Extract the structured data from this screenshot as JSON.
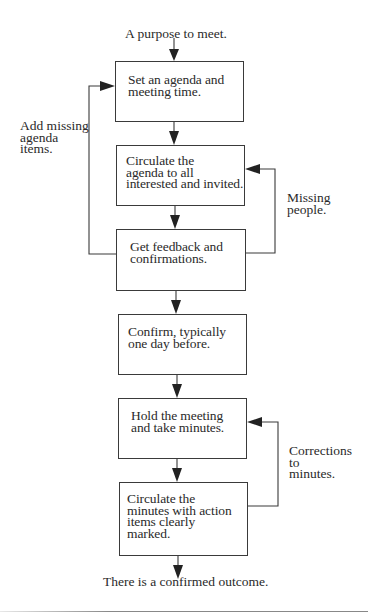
{
  "diagram": {
    "type": "flowchart",
    "start_label": "A purpose to meet.",
    "end_label": "There is a confirmed outcome.",
    "steps": [
      {
        "id": "step-1",
        "text": "Set an agenda and\nmeeting time."
      },
      {
        "id": "step-2",
        "text": "Circulate the\nagenda to all\ninterested and invited."
      },
      {
        "id": "step-3",
        "text": "Get feedback and\nconfirmations."
      },
      {
        "id": "step-4",
        "text": "Confirm, typically\none day before."
      },
      {
        "id": "step-5",
        "text": "Hold the meeting\nand take minutes."
      },
      {
        "id": "step-6",
        "text": "Circulate the\nminutes with action\nitems clearly\nmarked."
      }
    ],
    "loops": [
      {
        "from": "step-3",
        "to": "step-1",
        "side": "left",
        "label": "Add missing\nagenda\nitems."
      },
      {
        "from": "step-3",
        "to": "step-2",
        "side": "right",
        "label": "Missing\npeople."
      },
      {
        "from": "step-6",
        "to": "step-5",
        "side": "right",
        "label": "Corrections\n to\nminutes."
      }
    ],
    "colors": {
      "line": "#3a3a3a",
      "text": "#2a2a2a",
      "background": "#ffffff"
    }
  }
}
